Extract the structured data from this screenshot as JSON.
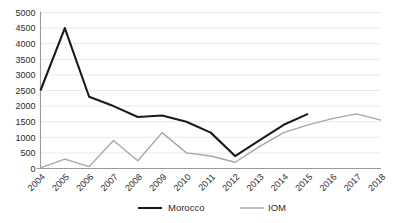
{
  "chart_data": {
    "type": "line",
    "title": "",
    "xlabel": "",
    "ylabel": "",
    "grid": true,
    "legend_position": "bottom",
    "categories": [
      "2004",
      "2005",
      "2006",
      "2007",
      "2008",
      "2009",
      "2010",
      "2011",
      "2012",
      "2013",
      "2014",
      "2015",
      "2016",
      "2017",
      "2018"
    ],
    "ylim": [
      0,
      5000
    ],
    "yticks": [
      "0",
      "500",
      "1000",
      "1500",
      "2000",
      "2500",
      "3000",
      "3500",
      "4000",
      "4500",
      "5000"
    ],
    "series": [
      {
        "name": "Morocco",
        "color": "#1b1b1b",
        "x": [
          "2004",
          "2005",
          "2006",
          "2007",
          "2008",
          "2009",
          "2010",
          "2011",
          "2012",
          "2013",
          "2014",
          "2015"
        ],
        "values": [
          2500,
          4500,
          2300,
          2000,
          1650,
          1700,
          1500,
          1150,
          400,
          900,
          1400,
          1750
        ]
      },
      {
        "name": "IOM",
        "color": "#a6a6a6",
        "x": [
          "2004",
          "2005",
          "2006",
          "2007",
          "2008",
          "2009",
          "2010",
          "2011",
          "2012",
          "2013",
          "2014",
          "2015",
          "2016",
          "2017",
          "2018"
        ],
        "values": [
          20,
          300,
          60,
          900,
          250,
          1150,
          500,
          400,
          200,
          700,
          1150,
          1400,
          1600,
          1750,
          1550
        ]
      }
    ]
  },
  "legend": {
    "items": [
      {
        "label": "Morocco"
      },
      {
        "label": "IOM"
      }
    ]
  }
}
